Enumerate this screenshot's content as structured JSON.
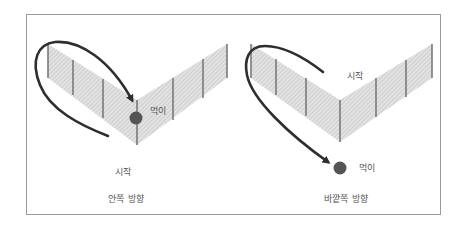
{
  "colors": {
    "frame": "#9a9a9a",
    "fence_fill": "#dcdcdc",
    "fence_hatch": "#b8b8b8",
    "post": "#7a7a7a",
    "arrow": "#2e2e2e",
    "prey": "#555555",
    "text": "#555555"
  },
  "panels": [
    {
      "id": "inward",
      "caption": "안쪽 방향",
      "start_label": "시작",
      "prey_label": "먹이",
      "description": "Arrow starts below the V-shaped fence, loops around the left fence end and curves into the inner corner where the prey sits."
    },
    {
      "id": "outward",
      "caption": "바깥쪽 방향",
      "start_label": "시작",
      "prey_label": "먹이",
      "description": "Arrow starts above the V-shaped fence, loops around the left fence end and heads down to the prey outside the corner."
    }
  ]
}
